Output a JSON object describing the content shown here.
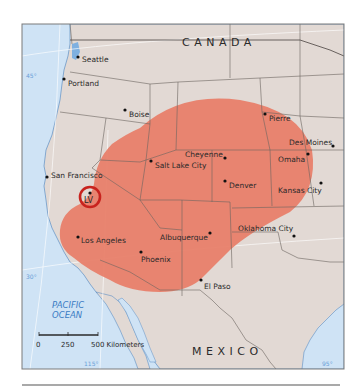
{
  "map": {
    "colors": {
      "land": "#e2d9d4",
      "water": "#cfe3f5",
      "region": "#e8806a",
      "highlight_ring": "#c8231e",
      "borders": "#6b6460",
      "frame": "#7a7a7a"
    },
    "countries": {
      "north": "CANADA",
      "south": "MEXICO"
    },
    "ocean": {
      "line1": "PACIFIC",
      "line2": "OCEAN"
    },
    "grid_labels": {
      "lat_45": "45°",
      "lat_30": "30°",
      "lon_115": "115°",
      "lon_95": "95°"
    },
    "scale_bar": {
      "ticks": [
        "0",
        "250",
        "500 Kilometers"
      ]
    },
    "highlight": {
      "label": "LV"
    },
    "cities": [
      {
        "name": "Seattle"
      },
      {
        "name": "Portland"
      },
      {
        "name": "Boise"
      },
      {
        "name": "Pierre"
      },
      {
        "name": "Des Moines"
      },
      {
        "name": "Omaha"
      },
      {
        "name": "Cheyenne"
      },
      {
        "name": "Salt Lake City"
      },
      {
        "name": "San Francisco"
      },
      {
        "name": "Denver"
      },
      {
        "name": "Kansas City"
      },
      {
        "name": "Los Angeles"
      },
      {
        "name": "Albuquerque"
      },
      {
        "name": "Oklahoma City"
      },
      {
        "name": "Phoenix"
      },
      {
        "name": "El Paso"
      }
    ]
  }
}
